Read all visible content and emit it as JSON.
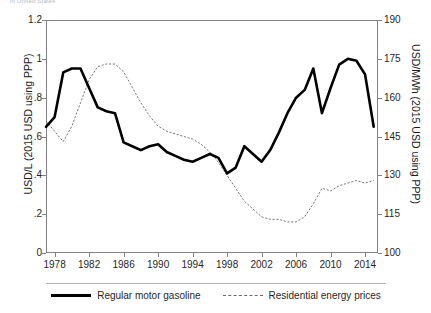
{
  "caption": {
    "cropped_text": "in United States"
  },
  "legend": {
    "position": "bottom-center",
    "entries": [
      {
        "label": "Regular motor gasoline",
        "style": "solid-thick",
        "color": "#000000"
      },
      {
        "label": "Residential energy prices",
        "style": "dotted-thin",
        "color": "#6b6b70"
      }
    ]
  },
  "axes": {
    "left": {
      "label": "USD/L (2015 USD using PPP)",
      "ticks": [
        "0",
        ".2",
        ".4",
        ".6",
        ".8",
        "1",
        "1.2"
      ],
      "min": 0,
      "max": 1.2
    },
    "right": {
      "label": "USD/MWh (2015 USD using PPP)",
      "ticks": [
        "100",
        "115",
        "130",
        "145",
        "160",
        "175",
        "190"
      ],
      "min": 100,
      "max": 190
    },
    "x": {
      "label": "",
      "ticks": [
        "1978",
        "1982",
        "1986",
        "1990",
        "1994",
        "1998",
        "2002",
        "2006",
        "2010",
        "2014"
      ],
      "min": 1977,
      "max": 2015.5
    }
  },
  "chart_data": {
    "type": "line",
    "title": "",
    "subtitle": "",
    "xlabel": "",
    "ylabel": "USD/L (2015 USD using PPP)",
    "ylabel_secondary": "USD/MWh (2015 USD using PPP)",
    "xlim": [
      1977,
      2015.5
    ],
    "ylim": [
      0,
      1.2
    ],
    "ylim_secondary": [
      100,
      190
    ],
    "grid": false,
    "legend": "bottom",
    "x": [
      1977,
      1978,
      1979,
      1980,
      1981,
      1982,
      1983,
      1984,
      1985,
      1986,
      1987,
      1988,
      1989,
      1990,
      1991,
      1992,
      1993,
      1994,
      1995,
      1996,
      1997,
      1998,
      1999,
      2000,
      2001,
      2002,
      2003,
      2004,
      2005,
      2006,
      2007,
      2008,
      2009,
      2010,
      2011,
      2012,
      2013,
      2014,
      2015
    ],
    "series": [
      {
        "name": "Regular motor gasoline",
        "axis": "left",
        "unit": "USD/L (2015 USD using PPP)",
        "style": "solid-thick",
        "color": "#000000",
        "values": [
          0.65,
          0.7,
          0.93,
          0.95,
          0.95,
          0.85,
          0.75,
          0.73,
          0.72,
          0.57,
          0.55,
          0.53,
          0.55,
          0.56,
          0.52,
          0.5,
          0.48,
          0.47,
          0.49,
          0.51,
          0.49,
          0.41,
          0.44,
          0.55,
          0.51,
          0.47,
          0.53,
          0.62,
          0.72,
          0.8,
          0.84,
          0.95,
          0.72,
          0.85,
          0.97,
          1.0,
          0.99,
          0.92,
          0.65
        ]
      },
      {
        "name": "Residential energy prices",
        "axis": "right",
        "unit": "USD/MWh (2015 USD using PPP)",
        "style": "dotted-thin",
        "color": "#6b6b70",
        "values": [
          151,
          147,
          143,
          149,
          158,
          167,
          172,
          173,
          173,
          170,
          164,
          158,
          153,
          149,
          147,
          146,
          145,
          144,
          142,
          139,
          135,
          130,
          125,
          120,
          117,
          114,
          113,
          113,
          112,
          112,
          114,
          119,
          125,
          124,
          126,
          127,
          128,
          127,
          128
        ]
      }
    ]
  }
}
